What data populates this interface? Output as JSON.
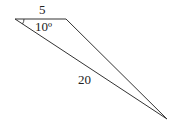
{
  "diagram": {
    "type": "triangle",
    "colors": {
      "stroke": "#333333",
      "text": "#222222",
      "background": "#ffffff"
    },
    "vertices": {
      "left": [
        15,
        19
      ],
      "top_right": [
        66,
        19
      ],
      "bottom": [
        167,
        119
      ]
    },
    "labels": {
      "top_side": "5",
      "angle": "10º",
      "long_side": "20"
    }
  }
}
